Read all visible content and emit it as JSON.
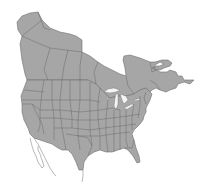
{
  "map": {
    "title": "",
    "region": "North America (United States and Canada)",
    "fill_color": "#a6a6a6",
    "border_color": "#6e6e6e",
    "background_color": "#ffffff",
    "labels": []
  }
}
